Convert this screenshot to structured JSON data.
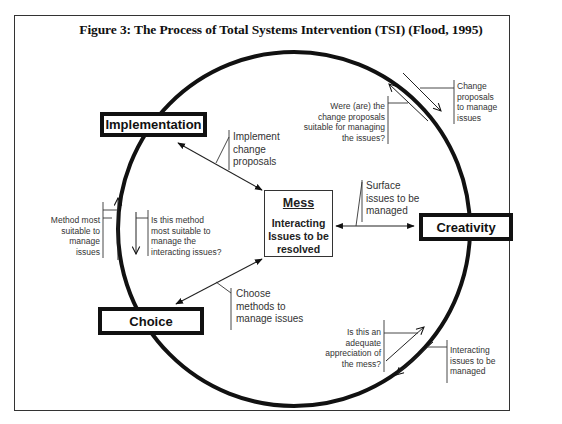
{
  "figure": {
    "title": "Figure 3: The Process of Total Systems Intervention (TSI) (Flood, 1995)"
  },
  "stages": {
    "implementation": "Implementation",
    "creativity": "Creativity",
    "choice": "Choice"
  },
  "mess": {
    "title": "Mess",
    "body": "Interacting Issues to be resolved"
  },
  "links": {
    "implement": "Implement\nchange\nproposals",
    "surface": "Surface\nissues to be\nmanaged",
    "choose": "Choose\nmethods to\nmanage issues"
  },
  "cycle_notes": {
    "creativity_to_implementation_forward": "Change\nproposals\nto manage\nissues",
    "creativity_to_implementation_back": "Were (are) the\nchange proposals\nsuitable for managing\nthe issues?",
    "implementation_choice_forward": "Is this method\nmost suitable to\nmanage the\ninteracting issues?",
    "implementation_choice_back": "Method most\nsuitable to\nmanage\nissues",
    "choice_creativity_forward": "Interacting\nissues to be\nmanaged",
    "choice_creativity_back": "Is this an\nadequate\nappreciation of\nthe mess?"
  },
  "colors": {
    "ink": "#111111",
    "frame": "#333333",
    "background": "#ffffff"
  }
}
